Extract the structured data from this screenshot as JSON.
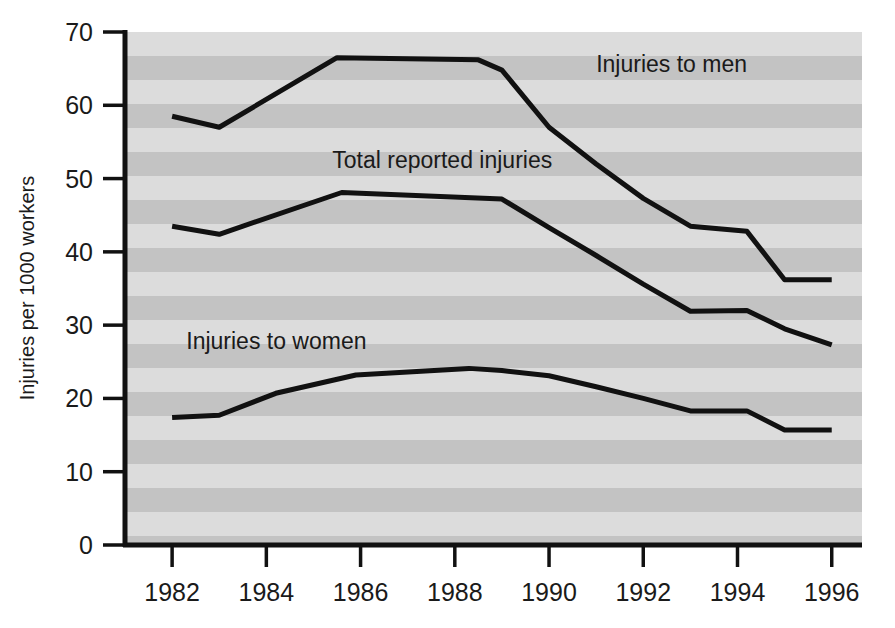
{
  "chart_data": {
    "type": "line",
    "title": "",
    "subtitle": "",
    "xlabel": "",
    "ylabel": "Injuries per 1000 workers",
    "xlim": [
      1981.0,
      1996.6
    ],
    "ylim": [
      0,
      70
    ],
    "x_ticks": [
      1982,
      1984,
      1986,
      1988,
      1990,
      1992,
      1994,
      1996
    ],
    "x_tick_labels": [
      "1982",
      "1984",
      "1986",
      "1988",
      "1990",
      "1992",
      "1994",
      "1996"
    ],
    "y_ticks": [
      0,
      10,
      20,
      30,
      40,
      50,
      60,
      70
    ],
    "y_tick_labels": [
      "0",
      "10",
      "20",
      "30",
      "40",
      "50",
      "60",
      "70"
    ],
    "grid": false,
    "background_bands": true,
    "legend": "inline-annotations",
    "line_color": "#111111",
    "plot_background": "#d0d0d0",
    "band_color_light": "#dcdcdc",
    "band_color_dark": "#c3c3c3",
    "series": [
      {
        "name": "Injuries to men",
        "annotation": "Injuries to men",
        "annotation_x": 1991.0,
        "annotation_y": 64.5,
        "x": [
          1982.0,
          1983.0,
          1985.5,
          1988.5,
          1989.0,
          1990.0,
          1991.0,
          1992.0,
          1993.0,
          1994.2,
          1995.0,
          1996.0
        ],
        "values": [
          58.5,
          57.0,
          66.5,
          66.2,
          64.8,
          57.0,
          52.0,
          47.3,
          43.5,
          42.8,
          36.2,
          36.2
        ]
      },
      {
        "name": "Total reported injuries",
        "annotation": "Total reported injuries",
        "annotation_x": 1985.4,
        "annotation_y": 51.5,
        "x": [
          1982.0,
          1983.0,
          1985.6,
          1989.0,
          1990.0,
          1991.0,
          1992.0,
          1993.0,
          1994.2,
          1995.0,
          1996.0
        ],
        "values": [
          43.5,
          42.4,
          48.1,
          47.2,
          43.3,
          39.5,
          35.6,
          31.9,
          32.0,
          29.5,
          27.3
        ]
      },
      {
        "name": "Injuries to women",
        "annotation": "Injuries to women",
        "annotation_x": 1982.3,
        "annotation_y": 26.8,
        "x": [
          1982.0,
          1983.0,
          1984.2,
          1985.9,
          1988.3,
          1989.0,
          1990.0,
          1991.0,
          1992.0,
          1993.0,
          1994.2,
          1995.0,
          1996.0
        ],
        "values": [
          17.4,
          17.7,
          20.7,
          23.2,
          24.1,
          23.8,
          23.1,
          21.6,
          20.0,
          18.3,
          18.3,
          15.7,
          15.7
        ]
      }
    ]
  },
  "axis": {
    "y_title": "Injuries per 1000 workers"
  }
}
